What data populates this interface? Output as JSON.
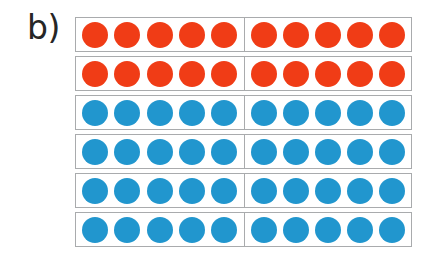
{
  "figure": {
    "panel_label": "b)",
    "colors": {
      "red": "#f03c16",
      "blue": "#2196ce",
      "rod_border": "#a9abad",
      "background": "#ffffff"
    }
  },
  "chart_data": {
    "type": "table",
    "title": "b)",
    "xlabel": "",
    "ylabel": "",
    "grid": false,
    "legend": [
      {
        "name": "red counters",
        "color": "#f03c16",
        "count": 20
      },
      {
        "name": "blue counters",
        "color": "#2196ce",
        "count": 40
      }
    ],
    "categories": [
      "row 1",
      "row 2",
      "row 3",
      "row 4",
      "row 5",
      "row 6"
    ],
    "values": [
      10,
      10,
      10,
      10,
      10,
      10
    ],
    "totals": {
      "rods": 6,
      "counters_per_rod": 10,
      "counters_per_half": 5,
      "red_rods": 2,
      "blue_rods": 4,
      "total_counters": 60
    },
    "rows": [
      {
        "index": 1,
        "color": "red",
        "hex": "#f03c16",
        "left_group": 5,
        "right_group": 5,
        "total": 10
      },
      {
        "index": 2,
        "color": "red",
        "hex": "#f03c16",
        "left_group": 5,
        "right_group": 5,
        "total": 10
      },
      {
        "index": 3,
        "color": "blue",
        "hex": "#2196ce",
        "left_group": 5,
        "right_group": 5,
        "total": 10
      },
      {
        "index": 4,
        "color": "blue",
        "hex": "#2196ce",
        "left_group": 5,
        "right_group": 5,
        "total": 10
      },
      {
        "index": 5,
        "color": "blue",
        "hex": "#2196ce",
        "left_group": 5,
        "right_group": 5,
        "total": 10
      },
      {
        "index": 6,
        "color": "blue",
        "hex": "#2196ce",
        "left_group": 5,
        "right_group": 5,
        "total": 10
      }
    ]
  }
}
